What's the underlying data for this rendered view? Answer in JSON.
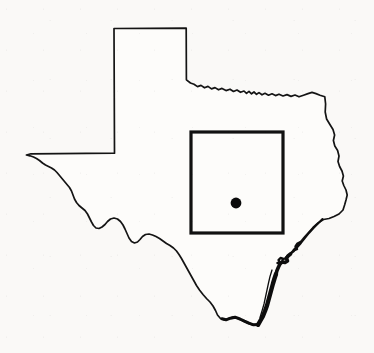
{
  "figure": {
    "kind": "map",
    "background_color": "#faf9f7",
    "ink_color": "#111111",
    "width": 374,
    "height": 353,
    "has_text_labels": false,
    "has_axes": false,
    "has_legend": false,
    "has_scale_bar": false,
    "has_north_arrow": false
  },
  "map": {
    "state_outline": {
      "name": "texas-state-outline",
      "stroke_color": "#141414",
      "stroke_width": 1.7,
      "fill_color": "#fdfcfa",
      "path": "M 114.5 153.2 L 114.0 28.5 L 186.2 28.2 L 186.4 79.8 L 190.5 83.0 L 194.0 84.2 L 197.5 86.6 L 201.0 85.4 L 204.5 87.8 L 208.0 86.4 L 211.5 88.9 L 215.0 87.6 L 218.5 89.8 L 222.0 88.4 L 226.0 90.6 L 230.0 89.2 L 233.5 91.5 L 237.0 90.0 L 240.5 92.3 L 244.0 91.0 L 246.5 93.4 L 249.0 91.4 L 251.5 93.8 L 254.0 92.0 L 256.5 94.3 L 259.0 92.6 L 262.0 94.8 L 265.0 93.3 L 268.5 95.2 L 272.0 93.8 L 275.5 95.6 L 279.0 94.2 L 283.0 96.0 L 287.0 94.6 L 291.0 96.4 L 295.0 95.0 L 299.0 96.8 L 303.5 95.2 L 308.0 93.6 L 312.0 92.4 L 316.0 93.6 L 320.0 95.2 L 324.8 96.8 L 325.6 104.0 L 325.2 112.0 L 326.6 119.0 L 329.6 124.0 L 333.0 129.5 L 334.6 135.0 L 333.4 140.5 L 334.8 146.0 L 337.6 150.5 L 339.0 156.0 L 338.0 161.5 L 339.6 166.5 L 342.0 171.0 L 343.4 176.0 L 342.2 181.0 L 343.8 185.5 L 346.0 190.0 L 347.2 195.0 L 346.0 200.0 L 344.6 205.0 L 343.0 210.0 L 339.0 214.0 L 334.0 216.5 L 329.0 218.5 L 323.5 219.5 L 318.0 223.0 L 313.0 227.5 L 308.5 232.5 L 304.0 237.5 L 300.0 242.5 L 296.0 247.0 L 292.5 251.0 L 289.0 254.5 L 285.5 257.5 L 282.0 261.0 L 279.0 265.0 L 277.0 269.5 L 275.5 274.0 L 274.0 279.0 L 272.5 284.0 L 271.0 289.5 L 269.5 295.0 L 268.0 300.5 L 266.5 306.0 L 264.5 311.5 L 262.5 317.0 L 260.0 321.5 L 257.8 325.2 L 253.0 325.0 L 248.0 323.5 L 243.0 321.0 L 238.0 318.5 L 233.0 317.0 L 228.5 318.5 L 224.5 320.0 L 220.5 318.5 L 217.5 315.0 L 215.5 310.5 L 213.0 306.0 L 210.0 302.0 L 206.5 298.5 L 203.0 294.5 L 199.5 290.0 L 196.5 285.5 L 194.0 281.0 L 191.5 276.5 L 189.0 272.0 L 186.5 267.5 L 184.0 263.0 L 181.5 258.5 L 179.0 254.5 L 176.5 251.0 L 173.5 248.0 L 170.0 245.5 L 166.5 243.5 L 163.0 241.0 L 159.5 238.5 L 156.0 236.5 L 152.5 235.0 L 149.0 234.0 L 145.5 234.5 L 142.5 236.5 L 140.0 239.5 L 137.5 242.0 L 134.5 243.0 L 131.5 241.5 L 129.0 238.0 L 127.0 233.5 L 125.0 229.0 L 123.0 225.0 L 120.5 221.5 L 117.5 219.0 L 114.0 218.0 L 110.5 219.0 L 107.5 221.5 L 105.0 224.5 L 102.0 227.0 L 99.0 228.5 L 96.0 228.0 L 93.5 225.5 L 91.5 222.0 L 89.5 218.0 L 87.5 214.0 L 85.0 210.5 L 82.0 208.0 L 79.0 205.5 L 76.5 202.5 L 74.5 199.0 L 73.0 195.0 L 71.5 191.0 L 69.5 187.5 L 67.0 184.5 L 64.5 181.5 L 62.0 178.5 L 59.5 175.5 L 57.0 172.5 L 54.5 170.0 L 51.5 168.0 L 48.5 166.5 L 45.5 165.0 L 42.5 163.0 L 39.5 160.5 L 36.5 158.5 L 33.5 157.0 L 30.0 155.8 L 26.4 155.0 L 31.0 153.8 Z"
    },
    "coast_detail": [
      {
        "name": "gulf-coast-barrier-islands-upper",
        "stroke_width": 2.0,
        "path": "M 322.5 219.0 L 318.0 223.5 L 313.5 228.0 L 309.0 233.0 L 305.0 238.0 L 301.0 243.0 L 297.0 247.5 L 293.5 251.5 L 290.5 254.0"
      },
      {
        "name": "gulf-coast-barrier-islands-mid",
        "stroke_width": 3.6,
        "path": "M 290.5 254.0 L 288.0 256.0 L 286.5 258.5 L 287.5 261.0 L 285.0 262.5 L 282.0 262.0 L 280.0 264.0 L 278.5 267.0 L 277.0 270.5 L 276.0 274.0"
      },
      {
        "name": "gulf-coast-barrier-islands-lower",
        "stroke_width": 4.4,
        "path": "M 276.0 274.0 L 274.5 278.5 L 273.0 283.5 L 271.5 289.0 L 270.0 294.5 L 268.5 300.0 L 267.0 305.5 L 265.0 311.0 L 262.8 316.5 L 260.2 321.0 L 258.0 324.8"
      },
      {
        "name": "laguna-madre-inner-line",
        "stroke_width": 1.3,
        "path": "M 272.0 270.0 L 270.0 276.5 L 268.5 283.0 L 267.0 290.0 L 265.5 297.0 L 264.0 304.0 L 262.0 311.0 L 260.0 317.5"
      },
      {
        "name": "galveston-bay-notch",
        "stroke_width": 2.4,
        "path": "M 300.5 242.0 L 297.5 243.5 L 295.5 246.5 L 297.0 249.0 L 294.0 250.0"
      },
      {
        "name": "corpus-christi-bay-notch",
        "stroke_width": 2.4,
        "path": "M 283.5 259.0 L 280.5 258.0 L 278.5 260.0 L 280.0 262.5 L 277.5 263.0"
      },
      {
        "name": "rio-grande-delta-tip",
        "stroke_width": 3.0,
        "path": "M 258.0 324.5 L 253.5 324.8 L 249.0 323.2 L 244.5 321.2 L 240.0 319.0 L 235.0 317.2 L 230.5 318.2 L 226.0 319.8 L 222.0 318.8"
      }
    ],
    "study_area_box": {
      "name": "study-area-box",
      "x": 191,
      "y": 132,
      "width": 92,
      "height": 101,
      "stroke_color": "#111111",
      "stroke_width": 3.2,
      "fill": "none"
    },
    "site_marker": {
      "name": "study-site-dot",
      "cx": 236,
      "cy": 203,
      "r": 5.4,
      "fill_color": "#0a0a0a"
    }
  }
}
